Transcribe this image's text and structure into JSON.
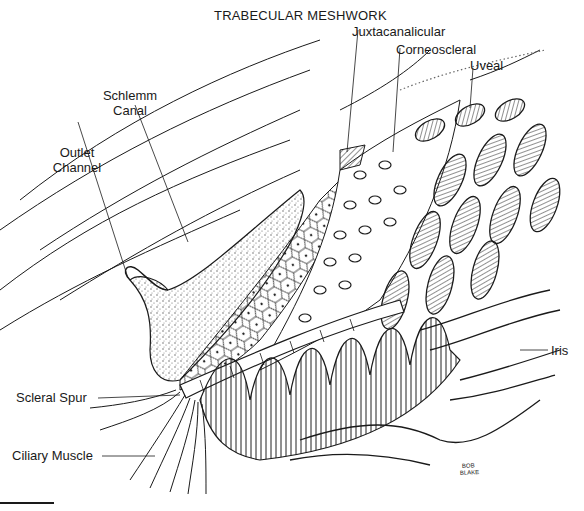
{
  "figure": {
    "title": "TRABECULAR MESHWORK",
    "signature": "BOB BLAKE",
    "labels": {
      "juxtacanalicular": "Juxtacanalicular",
      "corneoscleral": "Corneoscleral",
      "uveal": "Uveal",
      "schlemm_line1": "Schlemm",
      "schlemm_line2": "Canal",
      "outlet_line1": "Outlet",
      "outlet_line2": "Channel",
      "scleral_spur": "Scleral Spur",
      "ciliary_muscle": "Ciliary Muscle",
      "iris": "Iris"
    },
    "colors": {
      "ink": "#1a1a1a",
      "paper": "#ffffff",
      "stipple": "#555555"
    }
  }
}
